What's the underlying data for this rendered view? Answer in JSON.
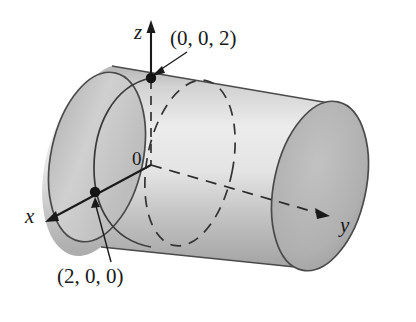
{
  "figure": {
    "type": "3d-diagram",
    "background_color": "#ffffff",
    "ink_color": "#1a1a1a",
    "axes": [
      {
        "id": "z",
        "label": "z",
        "direction": "up",
        "style": "solid-arrow"
      },
      {
        "id": "x",
        "label": "x",
        "direction": "down-left",
        "style": "solid-arrow"
      },
      {
        "id": "y",
        "label": "y",
        "direction": "right",
        "style": "dashed-arrow"
      }
    ],
    "origin_label": "0",
    "points": [
      {
        "id": "p002",
        "label": "(0, 0, 2)",
        "leader": "arrow-down-left"
      },
      {
        "id": "p200",
        "label": "(2, 0, 0)",
        "leader": "arrow-up"
      }
    ],
    "shading": {
      "body_light": "#eaeaea",
      "body_mid": "#cfcfcf",
      "body_dark": "#a9a9a9",
      "cap_front": "#c4c4c4",
      "cap_back": "#b2b2b2",
      "outline": "#3a3a3a"
    },
    "strokes": {
      "solid_circle": "front half of circle x^2+z^2=4 at y=0",
      "dashed_circle": "hidden cross-section circle",
      "dashed_axis": "y-axis hidden inside cylinder"
    }
  }
}
